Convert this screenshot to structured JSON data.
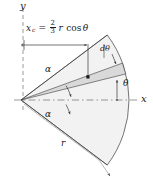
{
  "figure": {
    "kind": "circular-sector-centroid-diagram",
    "axes": {
      "y_label": "y",
      "x_label": "x",
      "origin_label": ""
    },
    "labels": {
      "alpha_upper": "α",
      "alpha_lower": "α",
      "theta": "θ",
      "dtheta": "dθ",
      "radius": "r"
    },
    "formula": {
      "variable": "x",
      "subscript": "c",
      "equals": "=",
      "fraction_numerator": "2",
      "fraction_denominator": "3",
      "radius_symbol": "r",
      "trig": "cos",
      "angle": "θ",
      "plain_text": "x_c = (2/3) r cos θ"
    },
    "colors": {
      "line": "#3b3b3b",
      "sector_fill": "#f2f2f2",
      "strip_fill": "#d9d9d9",
      "axis_dash": "#6e6e6e",
      "text": "#1a1a1a",
      "background": "#ffffff"
    },
    "geometry": {
      "apex_x": 21,
      "apex_y": 100,
      "radius_px": 108,
      "half_angle_deg": 37,
      "element_theta_deg": 17,
      "element_dtheta_deg": 6,
      "centroid_x_px": 88,
      "centroid_y_px": 77
    }
  }
}
